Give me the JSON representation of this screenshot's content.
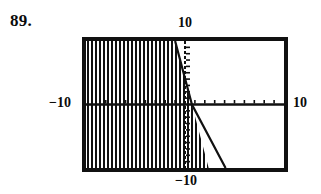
{
  "figure": {
    "problem_number": "89.",
    "kind": "graphing-calculator-screen",
    "labels": {
      "top": "10",
      "left": "−10",
      "right": "10",
      "bottom": "−10"
    },
    "colors": {
      "ink": "#111111",
      "background": "#ffffff"
    }
  },
  "chart_data": {
    "type": "line",
    "title": "",
    "subtitle": "",
    "xlabel": "",
    "ylabel": "",
    "xlim": [
      -10,
      10
    ],
    "ylim": [
      -10,
      10
    ],
    "grid": false,
    "legend": "none",
    "tick_spacing": {
      "x": 1,
      "y": 1
    },
    "axes": {
      "x_axis": {
        "style": "solid-with-ticks",
        "y_value": 0
      },
      "y_axis": {
        "style": "dashed-with-ticks",
        "x_value": 0
      }
    },
    "series": [
      {
        "name": "boundary-line",
        "style": "solid",
        "points": [
          {
            "x": -1.0,
            "y": 10.0
          },
          {
            "x": 0.7,
            "y": 0.0
          },
          {
            "x": 4.1,
            "y": -10.0
          }
        ],
        "slope": -5.9,
        "y_intercept": 4.1
      }
    ],
    "shaded_region": {
      "pattern": "vertical-hatch",
      "side": "left-of-boundary",
      "description": "Region to the left of the boundary line is filled with vertical hatch lines."
    },
    "annotations": [
      {
        "text": "10",
        "position": "top"
      },
      {
        "text": "−10",
        "position": "left"
      },
      {
        "text": "10",
        "position": "right"
      },
      {
        "text": "−10",
        "position": "bottom"
      }
    ]
  }
}
